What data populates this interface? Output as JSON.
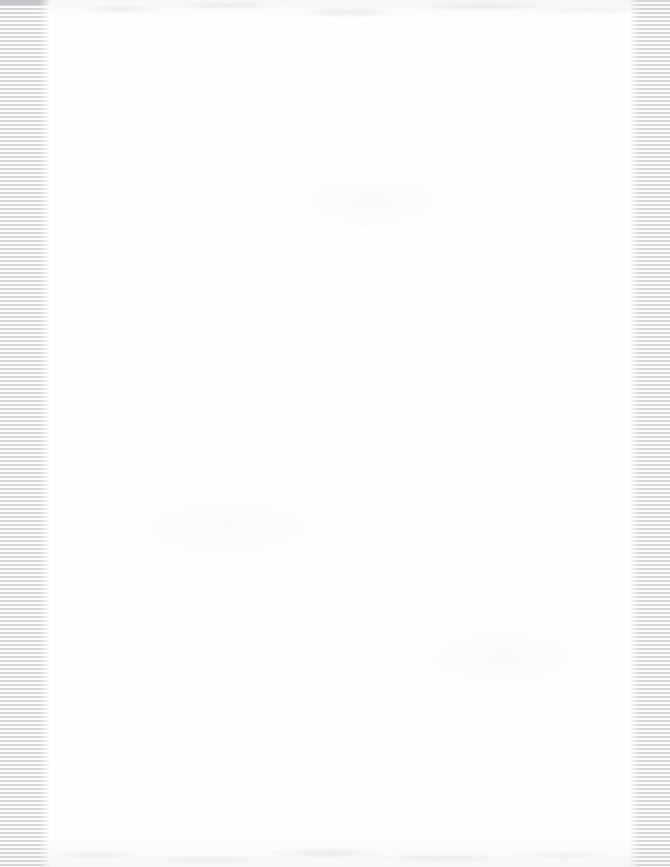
{
  "document": {
    "title": "",
    "kind": "blank-scanned-page",
    "page_width": 670,
    "page_height": 867,
    "body_text": "",
    "visible_text": "",
    "colors": {
      "paper": "#fefefe",
      "background": "#ffffff",
      "stripe_line": "#d6d7da",
      "band_cap": "#b9babd",
      "noise": "#c4c6ca"
    }
  },
  "artifacts": {
    "left_band": {
      "name": "scan-stripe-band-left",
      "x": 0,
      "width": 53,
      "stripe_period_px": 4,
      "stripe_orientation": "horizontal"
    },
    "right_band": {
      "name": "scan-stripe-band-right",
      "x": 630,
      "width": 40,
      "stripe_period_px": 4,
      "stripe_orientation": "horizontal"
    },
    "top_noise": {
      "name": "scanner-noise-top",
      "y": 0,
      "height": 22
    },
    "bottom_noise": {
      "name": "scanner-noise-bottom",
      "y": 837,
      "height": 30
    }
  }
}
